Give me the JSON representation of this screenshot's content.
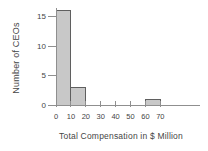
{
  "chart_data": {
    "type": "bar",
    "subtype": "histogram",
    "title": "",
    "xlabel": "Total Compensation in $ Million",
    "ylabel": "Number of CEOs",
    "bin_edges": [
      0,
      10,
      20,
      30,
      40,
      50,
      60,
      70
    ],
    "categories": [
      "0-10",
      "10-20",
      "20-30",
      "30-40",
      "40-50",
      "50-60",
      "60-70"
    ],
    "values": [
      16,
      3,
      0,
      0,
      0,
      0,
      1
    ],
    "x_ticks": [
      0,
      10,
      20,
      30,
      40,
      50,
      60,
      70
    ],
    "y_ticks": [
      0,
      5,
      10,
      15
    ],
    "xlim": [
      0,
      97
    ],
    "ylim": [
      0,
      16.5
    ],
    "grid": false,
    "legend": false,
    "colors": {
      "bar_fill": "#c8c8c8",
      "bar_stroke": "#5f5f5f",
      "axis": "#8f8f8f",
      "text": "#454545",
      "background": "#ffffff"
    }
  }
}
